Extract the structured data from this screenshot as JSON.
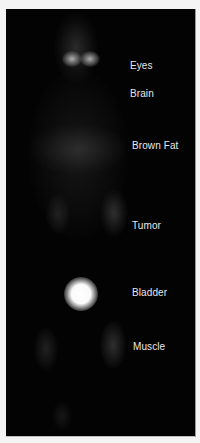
{
  "figure": {
    "labels": [
      {
        "text": "Eyes",
        "top": 51
      },
      {
        "text": "Brain",
        "top": 79
      },
      {
        "text": "Brown Fat",
        "top": 131
      },
      {
        "text": "Tumor",
        "top": 211
      },
      {
        "text": "Bladder",
        "top": 278
      },
      {
        "text": "Muscle",
        "top": 332
      }
    ]
  }
}
